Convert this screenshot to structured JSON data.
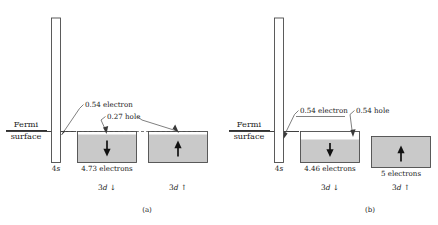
{
  "figure": {
    "type": "band-structure-diagram",
    "fill_color": "#c9c9c9",
    "outline_color": "#4a4a4a",
    "background": "#ffffff"
  },
  "common": {
    "fermi_label_line1": "Fermi",
    "fermi_label_line2": "surface",
    "s_band_label_prefix": "4",
    "s_band_label_italic": "s",
    "d_band_label_prefix": "3",
    "d_band_label_italic": "d",
    "spin_down_arrow": "↓",
    "spin_up_arrow": "↑"
  },
  "panels": [
    {
      "id": "a",
      "caption": "(a)",
      "s_band": {
        "name": "4s",
        "electron_label": "0.54 electron",
        "fill_fraction": 0.27
      },
      "d_down": {
        "name": "3d down",
        "electron_count_label": "4.73 electrons",
        "electrons": 4.73,
        "hole_label": "0.27 hole",
        "holes": 0.27,
        "spin": "down"
      },
      "d_up": {
        "name": "3d up",
        "electron_count_label": "",
        "electrons": 4.73,
        "hole_label": "0.27 hole",
        "holes": 0.27,
        "spin": "up"
      },
      "shared_hole_label": "0.27 hole"
    },
    {
      "id": "b",
      "caption": "(b)",
      "s_band": {
        "name": "4s",
        "electron_label": "0.54 electron",
        "fill_fraction": 0.27
      },
      "d_down": {
        "name": "3d down",
        "electron_count_label": "4.46 electrons",
        "electrons": 4.46,
        "hole_label": "0.54 hole",
        "holes": 0.54,
        "spin": "down"
      },
      "d_up": {
        "name": "3d up",
        "electron_count_label": "5 electrons",
        "electrons": 5,
        "hole_label": "",
        "holes": 0,
        "spin": "up"
      }
    }
  ]
}
